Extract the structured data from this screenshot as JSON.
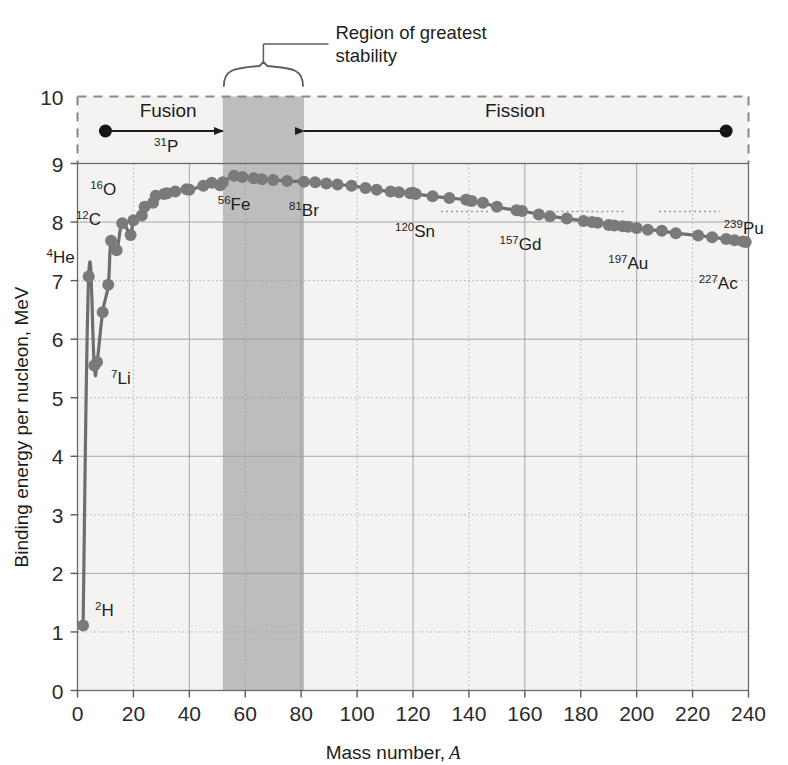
{
  "figure": {
    "background_color": "#ffffff",
    "plot_background_color": "#f4f3f1",
    "band_color": "#bdbdbd",
    "curve_color": "#6e6e6e",
    "marker_color": "#7a7a7a",
    "gridline_color": "#9a9a9a",
    "axis_color": "#5a5a5a",
    "text_color": "#1d1d1d"
  },
  "chart_data": {
    "type": "line",
    "title": "",
    "xlabel": "Mass number, A",
    "xlabel_plain": "Mass number,",
    "xlabel_italic": "A",
    "ylabel": "Binding energy per nucleon, MeV",
    "xlim": [
      0,
      240
    ],
    "ylim": [
      0,
      10
    ],
    "xticks": [
      0,
      20,
      40,
      60,
      80,
      100,
      120,
      140,
      160,
      180,
      200,
      220,
      240
    ],
    "yticks": [
      0,
      1,
      2,
      3,
      4,
      5,
      6,
      7,
      8,
      9,
      10
    ],
    "xtick_labels": [
      "0",
      "20",
      "40",
      "60",
      "80",
      "100",
      "120",
      "140",
      "160",
      "180",
      "200",
      "220",
      "240"
    ],
    "ytick_labels": [
      "0",
      "1",
      "2",
      "3",
      "4",
      "5",
      "6",
      "7",
      "8",
      "9",
      "10"
    ],
    "grid": true,
    "grid_major_x_every": 40,
    "grid_minor_x_every": 20,
    "grid_major_y_every": 2,
    "grid_minor_y_every": 1,
    "legend": "none",
    "plot_top_value": 9,
    "annotation_band_top_value": 10,
    "series": [
      {
        "name": "Binding energy per nucleon",
        "x": [
          2,
          4,
          6,
          7,
          9,
          11,
          12,
          14,
          16,
          19,
          20,
          23,
          24,
          27,
          28,
          31,
          32,
          35,
          39,
          40,
          45,
          48,
          51,
          52,
          56,
          59,
          63,
          66,
          70,
          75,
          81,
          85,
          89,
          93,
          98,
          103,
          107,
          112,
          115,
          119,
          120,
          121,
          127,
          133,
          139,
          141,
          145,
          150,
          157,
          159,
          165,
          169,
          175,
          181,
          184,
          186,
          190,
          192,
          195,
          197,
          200,
          204,
          209,
          214,
          222,
          227,
          232,
          235,
          238,
          239
        ],
        "y": [
          1.11,
          7.07,
          5.55,
          5.61,
          6.46,
          6.93,
          7.68,
          7.52,
          7.98,
          7.78,
          8.03,
          8.11,
          8.26,
          8.33,
          8.45,
          8.48,
          8.49,
          8.52,
          8.56,
          8.55,
          8.62,
          8.67,
          8.63,
          8.68,
          8.79,
          8.77,
          8.75,
          8.73,
          8.72,
          8.7,
          8.69,
          8.68,
          8.66,
          8.64,
          8.62,
          8.58,
          8.55,
          8.52,
          8.51,
          8.49,
          8.5,
          8.48,
          8.44,
          8.41,
          8.38,
          8.36,
          8.33,
          8.26,
          8.2,
          8.19,
          8.13,
          8.1,
          8.06,
          8.02,
          8.0,
          7.99,
          7.95,
          7.94,
          7.93,
          7.92,
          7.9,
          7.87,
          7.85,
          7.81,
          7.77,
          7.74,
          7.71,
          7.69,
          7.67,
          7.66
        ]
      }
    ],
    "point_labels": [
      {
        "sup": "2",
        "element": "H",
        "x": 2,
        "y": 1.11
      },
      {
        "sup": "4",
        "element": "He",
        "x": 4,
        "y": 7.07
      },
      {
        "sup": "7",
        "element": "Li",
        "x": 7,
        "y": 5.61
      },
      {
        "sup": "12",
        "element": "C",
        "x": 12,
        "y": 7.68
      },
      {
        "sup": "16",
        "element": "O",
        "x": 16,
        "y": 7.98
      },
      {
        "sup": "31",
        "element": "P",
        "x": 31,
        "y": 8.48
      },
      {
        "sup": "56",
        "element": "Fe",
        "x": 56,
        "y": 8.79
      },
      {
        "sup": "81",
        "element": "Br",
        "x": 81,
        "y": 8.69
      },
      {
        "sup": "120",
        "element": "Sn",
        "x": 120,
        "y": 8.5
      },
      {
        "sup": "157",
        "element": "Gd",
        "x": 157,
        "y": 8.2
      },
      {
        "sup": "197",
        "element": "Au",
        "x": 197,
        "y": 7.92
      },
      {
        "sup": "227",
        "element": "Ac",
        "x": 227,
        "y": 7.74
      },
      {
        "sup": "239",
        "element": "Pu",
        "x": 239,
        "y": 7.66
      }
    ]
  },
  "annotations": {
    "stability_region": {
      "label_line1": "Region of greatest",
      "label_line2": "stability",
      "band_x_start": 52,
      "band_x_end": 81
    },
    "fusion": {
      "label": "Fusion",
      "from_x": 10,
      "to_x": 52
    },
    "fission": {
      "label": "Fission",
      "from_x": 232,
      "to_x": 81
    }
  }
}
